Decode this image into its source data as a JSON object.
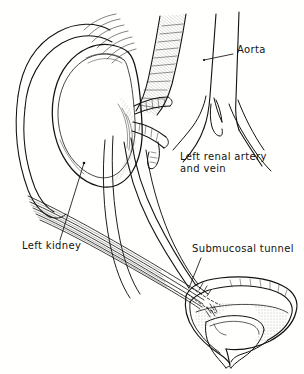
{
  "figure": {
    "kind": "anatomical-line-drawing",
    "background_color": "#ffffff",
    "ink_color": "#111111"
  },
  "labels": {
    "aorta": {
      "text": "Aorta",
      "x": 237,
      "y": 49
    },
    "renal_vessels": {
      "line1": "Left renal artery",
      "line2": "and vein",
      "x": 180,
      "y": 156
    },
    "kidney": {
      "text": "Left kidney",
      "x": 22,
      "y": 245
    },
    "tunnel": {
      "text": "Submucosal tunnel",
      "x": 192,
      "y": 248
    }
  },
  "structures": [
    {
      "name": "aorta",
      "label": "Aorta"
    },
    {
      "name": "left-renal-artery-and-vein",
      "label": "Left renal artery and vein"
    },
    {
      "name": "left-kidney",
      "label": "Left kidney"
    },
    {
      "name": "ureter",
      "label": "Ureter"
    },
    {
      "name": "urinary-bladder",
      "label": "Urinary bladder"
    },
    {
      "name": "submucosal-tunnel",
      "label": "Submucosal tunnel"
    },
    {
      "name": "iliac-vessels",
      "label": "Iliac vessels"
    },
    {
      "name": "psoas-muscle",
      "label": "Psoas muscle"
    }
  ]
}
